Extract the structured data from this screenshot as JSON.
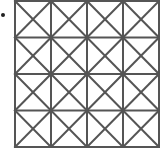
{
  "diagram": {
    "type": "grid-with-diagonals",
    "rows": 4,
    "cols": 4,
    "cell_diagonals": "both",
    "origin_x": 15,
    "origin_y": 1,
    "cell_w": 36,
    "cell_h": 36.5,
    "stroke_color": "#555555",
    "stroke_width": 2,
    "marker": {
      "x": 3,
      "y": 15,
      "r": 2,
      "color": "#222222"
    }
  }
}
